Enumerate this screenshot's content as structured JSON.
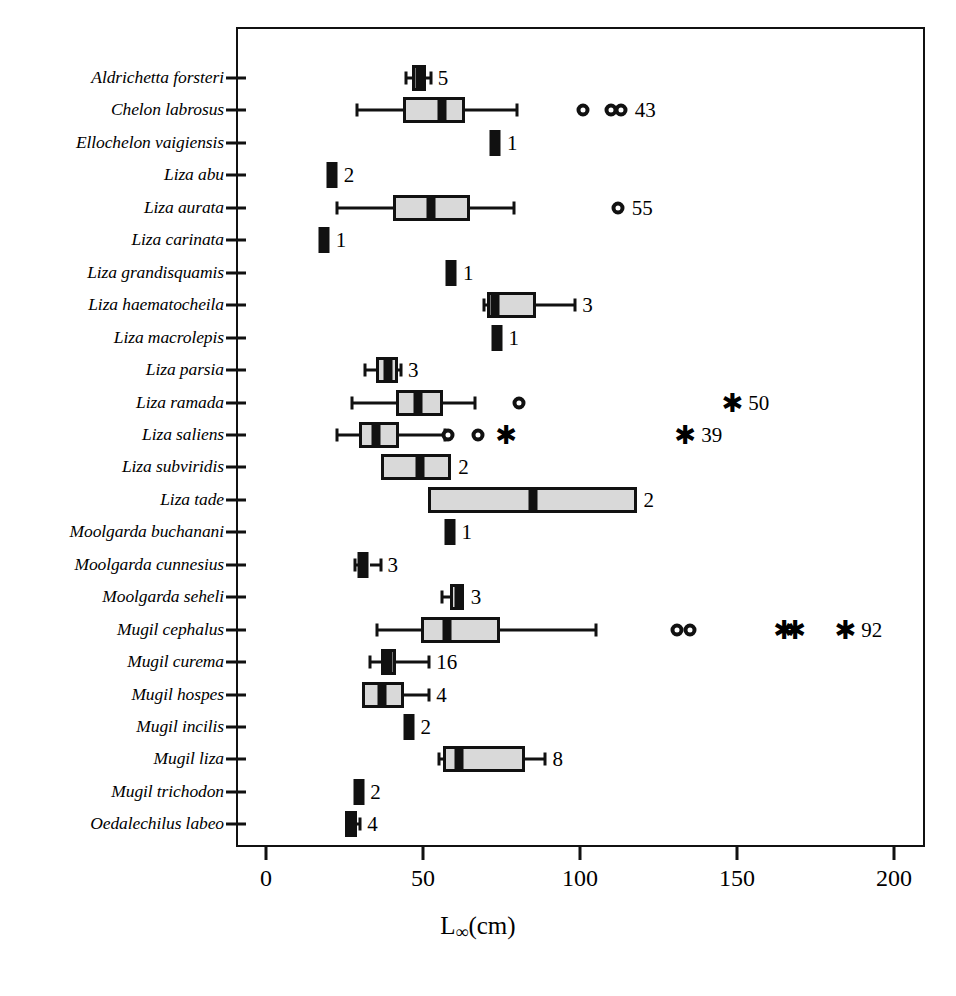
{
  "chart_data": {
    "type": "box",
    "title": "",
    "xlabel": "L∞(cm)",
    "xlabel_base": "L",
    "xlabel_sub": "∞",
    "xlabel_unit": "(cm)",
    "ylabel": "",
    "xlim": [
      0,
      210
    ],
    "xticks": [
      0,
      50,
      100,
      150,
      200
    ],
    "xticklabels": [
      "0",
      "50",
      "100",
      "150",
      "200"
    ],
    "grid": false,
    "legend": "none",
    "categories": [
      "Aldrichetta forsteri",
      "Chelon labrosus",
      "Ellochelon vaigiensis",
      "Liza abu",
      "Liza aurata",
      "Liza carinata",
      "Liza grandisquamis",
      "Liza haematocheila",
      "Liza macrolepis",
      "Liza parsia",
      "Liza ramada",
      "Liza saliens",
      "Liza subviridis",
      "Liza tade",
      "Moolgarda buchanani",
      "Moolgarda cunnesius",
      "Moolgarda seheli",
      "Mugil cephalus",
      "Mugil curema",
      "Mugil hospes",
      "Mugil incilis",
      "Mugil liza",
      "Mugil trichodon",
      "Oedalechilus labeo"
    ],
    "boxes": [
      {
        "species": "Aldrichetta forsteri",
        "n": 5,
        "min": 44.5,
        "q1": 46.5,
        "median": 49.0,
        "q3": 51.0,
        "max": 52.5,
        "outliers_circle": [],
        "outliers_star": []
      },
      {
        "species": "Chelon labrosus",
        "n": 43,
        "min": 29.0,
        "q1": 43.5,
        "median": 56.0,
        "q3": 63.5,
        "max": 80.0,
        "outliers_circle": [
          101,
          110,
          113
        ],
        "outliers_star": []
      },
      {
        "species": "Ellochelon vaigiensis",
        "n": 1,
        "min": 71.5,
        "q1": 71.5,
        "median": 73.0,
        "q3": 74.5,
        "max": 74.5,
        "outliers_circle": [],
        "outliers_star": []
      },
      {
        "species": "Liza abu",
        "n": 2,
        "min": 19.5,
        "q1": 19.5,
        "median": 21.0,
        "q3": 22.5,
        "max": 22.5,
        "outliers_circle": [],
        "outliers_star": []
      },
      {
        "species": "Liza aurata",
        "n": 55,
        "min": 22.5,
        "q1": 40.5,
        "median": 52.5,
        "q3": 65.0,
        "max": 79.0,
        "outliers_circle": [
          112
        ],
        "outliers_star": []
      },
      {
        "species": "Liza carinata",
        "n": 1,
        "min": 17.0,
        "q1": 17.0,
        "median": 18.5,
        "q3": 20.0,
        "max": 20.0,
        "outliers_circle": [],
        "outliers_star": []
      },
      {
        "species": "Liza grandisquamis",
        "n": 1,
        "min": 57.5,
        "q1": 57.5,
        "median": 59.0,
        "q3": 60.5,
        "max": 60.5,
        "outliers_circle": [],
        "outliers_star": []
      },
      {
        "species": "Liza haematocheila",
        "n": 3,
        "min": 69.5,
        "q1": 70.5,
        "median": 73.0,
        "q3": 86.0,
        "max": 98.5,
        "outliers_circle": [],
        "outliers_star": []
      },
      {
        "species": "Liza macrolepis",
        "n": 1,
        "min": 72.0,
        "q1": 72.0,
        "median": 73.5,
        "q3": 75.0,
        "max": 75.0,
        "outliers_circle": [],
        "outliers_star": []
      },
      {
        "species": "Liza parsia",
        "n": 3,
        "min": 31.5,
        "q1": 35.0,
        "median": 39.0,
        "q3": 42.0,
        "max": 43.0,
        "outliers_circle": [],
        "outliers_star": []
      },
      {
        "species": "Liza ramada",
        "n": 50,
        "min": 27.5,
        "q1": 41.5,
        "median": 48.5,
        "q3": 56.5,
        "max": 66.5,
        "outliers_circle": [
          80.5
        ],
        "outliers_star": [
          148.5
        ]
      },
      {
        "species": "Liza saliens",
        "n": 39,
        "min": 22.5,
        "q1": 29.5,
        "median": 35.0,
        "q3": 42.5,
        "max": 57.0,
        "outliers_circle": [
          58.0,
          67.5
        ],
        "outliers_star": [
          76.5,
          133.5
        ]
      },
      {
        "species": "Liza subviridis",
        "n": 2,
        "min": 36.5,
        "q1": 36.5,
        "median": 49.0,
        "q3": 59.0,
        "max": 59.0,
        "outliers_circle": [],
        "outliers_star": []
      },
      {
        "species": "Liza tade",
        "n": 2,
        "min": 51.5,
        "q1": 51.5,
        "median": 85.0,
        "q3": 118.0,
        "max": 118.0,
        "outliers_circle": [],
        "outliers_star": []
      },
      {
        "species": "Moolgarda buchanani",
        "n": 1,
        "min": 57.0,
        "q1": 57.0,
        "median": 58.5,
        "q3": 60.0,
        "max": 60.0,
        "outliers_circle": [],
        "outliers_star": []
      },
      {
        "species": "Moolgarda cunnesius",
        "n": 3,
        "min": 28.5,
        "q1": 29.5,
        "median": 31.0,
        "q3": 33.0,
        "max": 36.5,
        "outliers_circle": [],
        "outliers_star": []
      },
      {
        "species": "Moolgarda seheli",
        "n": 3,
        "min": 56.0,
        "q1": 58.5,
        "median": 61.5,
        "q3": 63.0,
        "max": 63.0,
        "outliers_circle": [],
        "outliers_star": []
      },
      {
        "species": "Mugil cephalus",
        "n": 92,
        "min": 35.5,
        "q1": 49.5,
        "median": 57.5,
        "q3": 74.5,
        "max": 105.0,
        "outliers_circle": [
          131,
          135
        ],
        "outliers_star": [
          165,
          168.5,
          184.5
        ]
      },
      {
        "species": "Mugil curema",
        "n": 16,
        "min": 33.0,
        "q1": 36.5,
        "median": 39.0,
        "q3": 41.5,
        "max": 52.0,
        "outliers_circle": [],
        "outliers_star": []
      },
      {
        "species": "Mugil hospes",
        "n": 4,
        "min": 30.5,
        "q1": 30.5,
        "median": 37.0,
        "q3": 44.0,
        "max": 52.0,
        "outliers_circle": [],
        "outliers_star": []
      },
      {
        "species": "Mugil incilis",
        "n": 2,
        "min": 44.0,
        "q1": 44.0,
        "median": 45.5,
        "q3": 47.0,
        "max": 47.0,
        "outliers_circle": [],
        "outliers_star": []
      },
      {
        "species": "Mugil liza",
        "n": 8,
        "min": 55.0,
        "q1": 56.5,
        "median": 61.5,
        "q3": 82.5,
        "max": 89.0,
        "outliers_circle": [],
        "outliers_star": []
      },
      {
        "species": "Mugil trichodon",
        "n": 2,
        "min": 28.0,
        "q1": 28.0,
        "median": 29.5,
        "q3": 31.0,
        "max": 31.0,
        "outliers_circle": [],
        "outliers_star": []
      },
      {
        "species": "Oedalechilus labeo",
        "n": 4,
        "min": 25.0,
        "q1": 25.0,
        "median": 27.0,
        "q3": 29.0,
        "max": 30.0,
        "outliers_circle": [],
        "outliers_star": []
      }
    ],
    "count_labels": [
      "5",
      "43",
      "1",
      "2",
      "55",
      "1",
      "1",
      "3",
      "1",
      "3",
      "50",
      "39",
      "2",
      "2",
      "1",
      "3",
      "3",
      "92",
      "16",
      "4",
      "2",
      "8",
      "2",
      "4"
    ],
    "colors": {
      "box_fill": "#d9d9d9",
      "line": "#111111",
      "median": "#111111",
      "background": "#ffffff"
    }
  },
  "caption": {
    "text": ""
  }
}
